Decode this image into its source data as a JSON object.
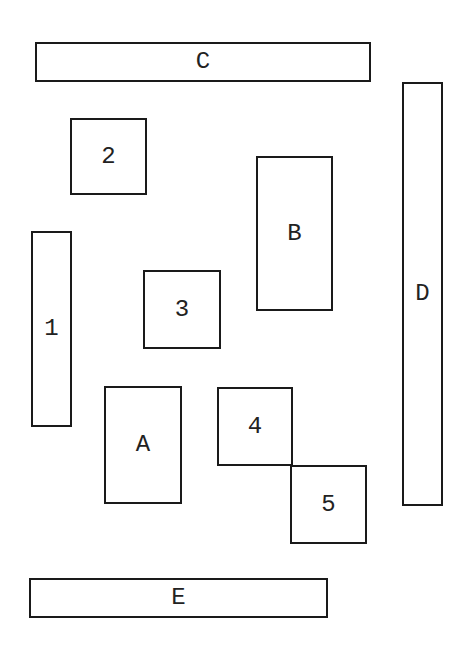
{
  "diagram": {
    "title": "",
    "boxes": [
      {
        "id": "C",
        "label": "C",
        "x": 35,
        "y": 42,
        "w": 336,
        "h": 40
      },
      {
        "id": "2",
        "label": "2",
        "x": 70,
        "y": 118,
        "w": 77,
        "h": 77
      },
      {
        "id": "D",
        "label": "D",
        "x": 402,
        "y": 82,
        "w": 41,
        "h": 424
      },
      {
        "id": "B",
        "label": "B",
        "x": 256,
        "y": 156,
        "w": 77,
        "h": 155
      },
      {
        "id": "1",
        "label": "1",
        "x": 31,
        "y": 231,
        "w": 41,
        "h": 196
      },
      {
        "id": "3",
        "label": "3",
        "x": 143,
        "y": 270,
        "w": 78,
        "h": 79
      },
      {
        "id": "A",
        "label": "A",
        "x": 104,
        "y": 386,
        "w": 78,
        "h": 118
      },
      {
        "id": "4",
        "label": "4",
        "x": 217,
        "y": 387,
        "w": 76,
        "h": 79
      },
      {
        "id": "5",
        "label": "5",
        "x": 290,
        "y": 465,
        "w": 77,
        "h": 79
      },
      {
        "id": "E",
        "label": "E",
        "x": 29,
        "y": 578,
        "w": 299,
        "h": 40
      }
    ]
  }
}
